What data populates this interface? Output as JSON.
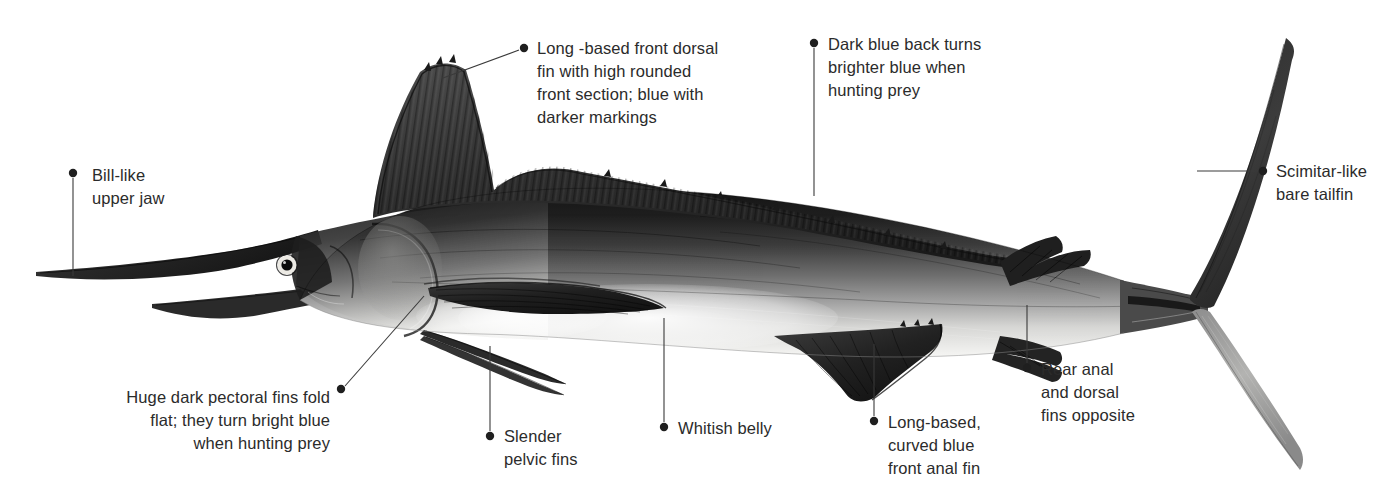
{
  "figure": {
    "subject_caption": "Labelled grayscale illustration of a marlin in side profile",
    "background_color": "#ffffff",
    "text_color": "#2b2b2b",
    "leader_color": "#3a3a3a",
    "bullet_color": "#1f1f1f",
    "art": {
      "body_dark": "#1c1c1c",
      "body_mid": "#6e6e6e",
      "body_light": "#c9c9c9",
      "belly_white": "#f4f4f2",
      "fin_dark": "#242424",
      "fin_mid": "#5a5a5a",
      "eye_ring": "#f2f2f0",
      "eye_pupil": "#111111"
    }
  },
  "callouts": [
    {
      "id": "bill",
      "name": "bill-like-upper-jaw",
      "text": "Bill-like\nupper jaw",
      "align": "left",
      "text_x": 92,
      "text_y": 164,
      "bullet_x": 73,
      "bullet_y": 173,
      "leader": "M 73 178 L 73 276"
    },
    {
      "id": "dorsal-front",
      "name": "long-based-front-dorsal-fin",
      "text": "Long -based front dorsal\nfin with high rounded\nfront section; blue with\ndarker markings",
      "align": "left",
      "text_x": 537,
      "text_y": 37,
      "bullet_x": 524,
      "bullet_y": 48,
      "leader": "M 519 50 L 443 78"
    },
    {
      "id": "dark-back",
      "name": "dark-blue-back",
      "text": "Dark blue back turns\nbrighter blue when\nhunting prey",
      "align": "left",
      "text_x": 828,
      "text_y": 33,
      "bullet_x": 814,
      "bullet_y": 43,
      "leader": "M 814 48 L 814 196"
    },
    {
      "id": "tailfin",
      "name": "scimitar-like-bare-tailfin",
      "text": "Scimitar-like\nbare tailfin",
      "align": "left",
      "text_x": 1276,
      "text_y": 160,
      "bullet_x": 1263,
      "bullet_y": 171,
      "leader": "M 1258 171 L 1197 171"
    },
    {
      "id": "pectoral",
      "name": "huge-dark-pectoral-fins",
      "text": "Huge dark pectoral fins fold\nflat; they turn bright blue\nwhen hunting prey",
      "align": "right",
      "text_right_x": 330,
      "text_y": 386,
      "bullet_x": 341,
      "bullet_y": 389,
      "leader": "M 345 386 L 424 296"
    },
    {
      "id": "pelvic",
      "name": "slender-pelvic-fins",
      "text": "Slender\npelvic fins",
      "align": "left",
      "text_x": 504,
      "text_y": 425,
      "bullet_x": 490,
      "bullet_y": 436,
      "leader": "M 490 431 L 490 346"
    },
    {
      "id": "belly",
      "name": "whitish-belly",
      "text": "Whitish belly",
      "align": "left",
      "text_x": 678,
      "text_y": 417,
      "bullet_x": 664,
      "bullet_y": 427,
      "leader": "M 664 422 L 664 318"
    },
    {
      "id": "anal-front",
      "name": "long-based-curved-front-anal-fin",
      "text": "Long-based,\ncurved blue\nfront anal fin",
      "align": "left",
      "text_x": 888,
      "text_y": 411,
      "bullet_x": 874,
      "bullet_y": 421,
      "leader": "M 874 416 L 874 344"
    },
    {
      "id": "rear-fins",
      "name": "rear-anal-and-dorsal-fins",
      "text": "Rear anal\nand dorsal\nfins opposite",
      "align": "left",
      "text_x": 1041,
      "text_y": 358,
      "bullet_x": 1027,
      "bullet_y": 368,
      "leader": "M 1027 363 L 1027 305"
    }
  ]
}
